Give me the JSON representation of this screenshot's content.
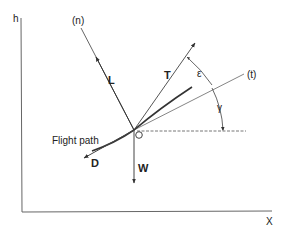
{
  "diagram": {
    "axes": {
      "vertical_label": "h",
      "horizontal_label": "X"
    },
    "lines": {
      "normal_label": "(n)",
      "tangent_label": "(t)"
    },
    "forces": {
      "lift": "L",
      "thrust": "T",
      "drag": "D",
      "weight": "W"
    },
    "angles": {
      "thrust_angle": "ε",
      "flight_path_angle": "γ"
    },
    "curve_label": "Flight path",
    "colors": {
      "line": "#555555",
      "text": "#222222",
      "background": "#ffffff"
    }
  }
}
